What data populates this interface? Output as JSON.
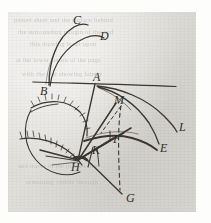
{
  "document": {
    "kind": "handwritten manuscript diagram",
    "medium": "brown-black ink on aged gray paper",
    "paper": {
      "background_color": "#d9d7d2",
      "ink_color": "#3a3632",
      "margin_color": "#fdfdfc"
    }
  },
  "ghost_text": {
    "note": "faint show-through printing from the reverse side of the leaf",
    "lines": [
      "pasted sheet and the surface behind",
      "the surrounding margin of the leaf",
      "this drawing is set upon",
      "at the lower centre of the page",
      "with the text showing faintly",
      "and traces of the printed line",
      "remaining visible through"
    ]
  },
  "diagram": {
    "labels": [
      {
        "id": "C",
        "text": "C",
        "x": 73,
        "y": 24,
        "size": 12
      },
      {
        "id": "D",
        "text": "D",
        "x": 100,
        "y": 40,
        "size": 12.5
      },
      {
        "id": "B",
        "text": "B",
        "x": 40,
        "y": 95,
        "size": 12
      },
      {
        "id": "A",
        "text": "A",
        "x": 93,
        "y": 81,
        "size": 11.5
      },
      {
        "id": "M",
        "text": "M",
        "x": 118,
        "y": 104,
        "size": 9.5
      },
      {
        "id": "L",
        "text": "L",
        "x": 179,
        "y": 131,
        "size": 12
      },
      {
        "id": "E",
        "text": "E",
        "x": 160,
        "y": 150,
        "size": 11
      },
      {
        "id": "F",
        "text": "F",
        "x": 113,
        "y": 143,
        "size": 10.5
      },
      {
        "id": "K",
        "text": "K",
        "x": 94,
        "y": 153,
        "size": 10
      },
      {
        "id": "H",
        "text": "H",
        "x": 72,
        "y": 170,
        "size": 12
      },
      {
        "id": "G",
        "text": "G",
        "x": 126,
        "y": 200,
        "size": 12
      }
    ],
    "elements": [
      {
        "name": "baseline-through-B-and-A",
        "type": "straight-line"
      },
      {
        "name": "arc-B-to-C",
        "type": "curve"
      },
      {
        "name": "arc-B-to-D",
        "type": "curve"
      },
      {
        "name": "curve-A-to-L",
        "type": "curve"
      },
      {
        "name": "curve-A-to-E",
        "type": "curve"
      },
      {
        "name": "hatched-arc-upper",
        "type": "hatched-arc"
      },
      {
        "name": "hatched-arc-lower",
        "type": "hatched-arc"
      },
      {
        "name": "circle-arc-through-H",
        "type": "arc"
      },
      {
        "name": "line-A-to-H",
        "type": "straight-line"
      },
      {
        "name": "line-M-to-H",
        "type": "straight-line"
      },
      {
        "name": "line-H-to-G",
        "type": "straight-line"
      },
      {
        "name": "dashed-line-to-G",
        "type": "dashed-line"
      },
      {
        "name": "ray-bundle-at-H",
        "type": "line-bundle"
      }
    ]
  }
}
